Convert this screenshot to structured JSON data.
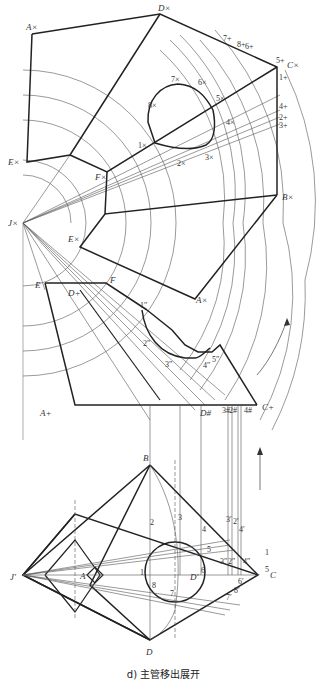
{
  "caption": "d) 主管移出展开",
  "labels": {
    "A_x": "A×",
    "D_x": "D×",
    "C_x": "C×",
    "B_x": "B×",
    "E_x": "E×",
    "J_x": "J×",
    "F_x": "F×",
    "E_x2": "E×",
    "E": "E",
    "F": "F",
    "D_plus": "D+",
    "A_x_lower": "A×",
    "A_plus": "A+",
    "D_hash": "D#",
    "C_plus": "C+",
    "top_7p": "7+",
    "top_8p": "8+",
    "top_6p": "6+",
    "top_5p": "5+",
    "top_1p": "1+",
    "r_4p": "4+",
    "r_2p": "2+",
    "r_3p": "3+",
    "c_7x": "7×",
    "c_6x": "6×",
    "c_8x": "8×",
    "c_5x": "5×",
    "c_4x": "4×",
    "c_1x": "1×",
    "c_2x": "2×",
    "c_3x": "3×",
    "l_1": "1″",
    "l_2": "2″",
    "l_3": "3″",
    "l_4": "4″",
    "l_5": "5″",
    "b_3": "3#",
    "b_2": "2#",
    "b_4": "4#",
    "B": "B",
    "J_prime": "J′",
    "A": "A",
    "D_prime": "D′",
    "C": "C",
    "D": "D",
    "p1": "1",
    "p2": "2",
    "p3": "3",
    "p4": "4",
    "p5": "5",
    "p6": "6",
    "p7": "7",
    "p8": "8",
    "p3p": "3′",
    "p2p": "2′",
    "p4p": "4′",
    "p6p": "6′",
    "p8p": "8′",
    "p7p": "7′",
    "q3": "3″",
    "q2": "2″",
    "q4": "4″",
    "q1": "1",
    "q5": "5"
  }
}
